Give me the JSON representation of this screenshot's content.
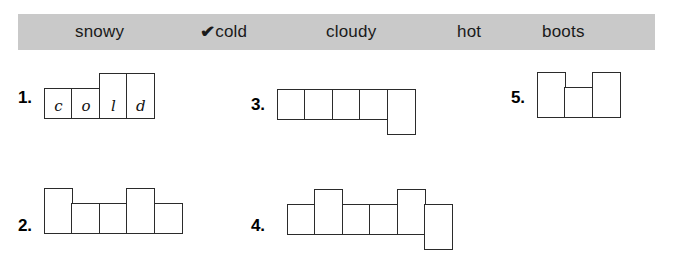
{
  "word_bank": {
    "name": "word-bank",
    "background_color": "#c9c9c9",
    "words": [
      {
        "label": "snowy",
        "checked": false,
        "check_mark": ""
      },
      {
        "label": "cold",
        "checked": true,
        "check_mark": "✔"
      },
      {
        "label": "cloudy",
        "checked": false,
        "check_mark": ""
      },
      {
        "label": "hot",
        "checked": false,
        "check_mark": ""
      },
      {
        "label": "boots",
        "checked": false,
        "check_mark": ""
      }
    ]
  },
  "problems": [
    {
      "number": "1.",
      "answer": "cold",
      "cells": [
        {
          "shape": "short",
          "letter": "c"
        },
        {
          "shape": "short",
          "letter": "o"
        },
        {
          "shape": "tall",
          "letter": "l"
        },
        {
          "shape": "tall",
          "letter": "d"
        }
      ]
    },
    {
      "number": "2.",
      "answer": "",
      "cells": [
        {
          "shape": "tall",
          "letter": ""
        },
        {
          "shape": "short",
          "letter": ""
        },
        {
          "shape": "short",
          "letter": ""
        },
        {
          "shape": "tall",
          "letter": ""
        },
        {
          "shape": "short",
          "letter": ""
        }
      ]
    },
    {
      "number": "3.",
      "answer": "",
      "cells": [
        {
          "shape": "short",
          "letter": ""
        },
        {
          "shape": "short",
          "letter": ""
        },
        {
          "shape": "short",
          "letter": ""
        },
        {
          "shape": "short",
          "letter": ""
        },
        {
          "shape": "desc",
          "letter": ""
        }
      ]
    },
    {
      "number": "4.",
      "answer": "",
      "cells": [
        {
          "shape": "short",
          "letter": ""
        },
        {
          "shape": "tall",
          "letter": ""
        },
        {
          "shape": "short",
          "letter": ""
        },
        {
          "shape": "short",
          "letter": ""
        },
        {
          "shape": "tall",
          "letter": ""
        },
        {
          "shape": "desc",
          "letter": ""
        }
      ]
    },
    {
      "number": "5.",
      "answer": "",
      "cells": [
        {
          "shape": "tall",
          "letter": ""
        },
        {
          "shape": "short",
          "letter": ""
        },
        {
          "shape": "tall",
          "letter": ""
        }
      ]
    }
  ]
}
